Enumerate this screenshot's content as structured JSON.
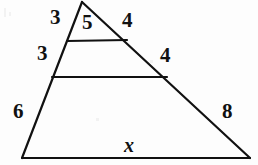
{
  "figure": {
    "kind": "geometry-diagram",
    "background_color": "#fdfdfd",
    "stroke_color": "#111111",
    "stroke_width": 2.2,
    "width": 258,
    "height": 165,
    "points": {
      "apex": {
        "x": 82,
        "y": 2
      },
      "left_upper": {
        "x": 67,
        "y": 41
      },
      "left_mid": {
        "x": 52,
        "y": 77
      },
      "bottom_left": {
        "x": 22,
        "y": 158
      },
      "right_upper": {
        "x": 127,
        "y": 40
      },
      "right_mid": {
        "x": 167,
        "y": 77
      },
      "bottom_right": {
        "x": 250,
        "y": 158
      }
    },
    "segments": [
      {
        "name": "left-side",
        "from": "apex",
        "to": "bottom_left"
      },
      {
        "name": "right-side",
        "from": "apex",
        "to": "bottom_right"
      },
      {
        "name": "base",
        "from": "bottom_left",
        "to": "bottom_right"
      },
      {
        "name": "upper-parallel-segment",
        "from": "left_upper",
        "to": "right_upper"
      },
      {
        "name": "lower-parallel-segment",
        "from": "left_mid",
        "to": "right_mid"
      }
    ],
    "labels": [
      {
        "id": "left-top",
        "text": "3",
        "x": 50,
        "y": 7,
        "name": "label-left-top-3"
      },
      {
        "id": "top-segment",
        "text": "5",
        "x": 82,
        "y": 12,
        "name": "label-top-segment-5"
      },
      {
        "id": "right-top",
        "text": "4",
        "x": 122,
        "y": 10,
        "name": "label-right-top-4"
      },
      {
        "id": "left-middle",
        "text": "3",
        "x": 37,
        "y": 43,
        "name": "label-left-middle-3"
      },
      {
        "id": "right-middle",
        "text": "4",
        "x": 160,
        "y": 45,
        "name": "label-right-middle-4"
      },
      {
        "id": "left-bottom",
        "text": "6",
        "x": 13,
        "y": 101,
        "name": "label-left-bottom-6"
      },
      {
        "id": "right-bottom",
        "text": "8",
        "x": 222,
        "y": 101,
        "name": "label-right-bottom-8"
      },
      {
        "id": "base",
        "text": "x",
        "x": 124,
        "y": 135,
        "name": "label-base-x"
      }
    ]
  }
}
